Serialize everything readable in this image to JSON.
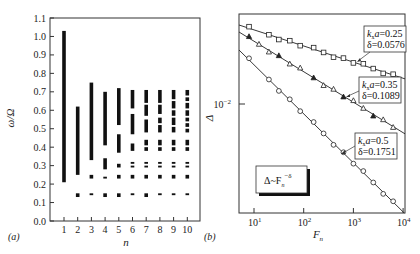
{
  "chart_data": [
    {
      "panel": "(a)",
      "type": "bar",
      "subtype": "range-bars (band spectrum)",
      "xlabel": "n",
      "ylabel": "ω/Ω",
      "ylim": [
        0.0,
        1.1
      ],
      "yticks": [
        "0.0",
        "0.1",
        "0.2",
        "0.3",
        "0.4",
        "0.5",
        "0.6",
        "0.7",
        "0.8",
        "0.9",
        "1.0",
        "1.1"
      ],
      "categories": [
        "1",
        "2",
        "3",
        "4",
        "5",
        "6",
        "7",
        "8",
        "9",
        "10"
      ],
      "bands": [
        {
          "n": 1,
          "ranges": [
            [
              0.21,
              1.03
            ]
          ]
        },
        {
          "n": 2,
          "ranges": [
            [
              0.13,
              0.15
            ],
            [
              0.25,
              0.62
            ]
          ]
        },
        {
          "n": 3,
          "ranges": [
            [
              0.14,
              0.15
            ],
            [
              0.23,
              0.25
            ],
            [
              0.33,
              0.75
            ]
          ]
        },
        {
          "n": 4,
          "ranges": [
            [
              0.13,
              0.15
            ],
            [
              0.23,
              0.24
            ],
            [
              0.28,
              0.34
            ],
            [
              0.41,
              0.7
            ]
          ]
        },
        {
          "n": 5,
          "ranges": [
            [
              0.13,
              0.15
            ],
            [
              0.23,
              0.25
            ],
            [
              0.29,
              0.31
            ],
            [
              0.37,
              0.47
            ],
            [
              0.52,
              0.72
            ]
          ]
        },
        {
          "n": 6,
          "ranges": [
            [
              0.14,
              0.15
            ],
            [
              0.23,
              0.25
            ],
            [
              0.29,
              0.3
            ],
            [
              0.31,
              0.32
            ],
            [
              0.38,
              0.42
            ],
            [
              0.47,
              0.58
            ],
            [
              0.61,
              0.71
            ]
          ]
        },
        {
          "n": 7,
          "ranges": [
            [
              0.13,
              0.15
            ],
            [
              0.23,
              0.25
            ],
            [
              0.29,
              0.3
            ],
            [
              0.31,
              0.32
            ],
            [
              0.38,
              0.4
            ],
            [
              0.41,
              0.44
            ],
            [
              0.48,
              0.55
            ],
            [
              0.57,
              0.63
            ],
            [
              0.64,
              0.71
            ]
          ]
        },
        {
          "n": 8,
          "ranges": [
            [
              0.14,
              0.15
            ],
            [
              0.23,
              0.25
            ],
            [
              0.29,
              0.3
            ],
            [
              0.31,
              0.32
            ],
            [
              0.38,
              0.4
            ],
            [
              0.41,
              0.44
            ],
            [
              0.48,
              0.52
            ],
            [
              0.53,
              0.56
            ],
            [
              0.58,
              0.63
            ],
            [
              0.64,
              0.71
            ]
          ]
        },
        {
          "n": 9,
          "ranges": [
            [
              0.14,
              0.15
            ],
            [
              0.23,
              0.25
            ],
            [
              0.29,
              0.3
            ],
            [
              0.31,
              0.32
            ],
            [
              0.38,
              0.4
            ],
            [
              0.41,
              0.44
            ],
            [
              0.48,
              0.51
            ],
            [
              0.52,
              0.56
            ],
            [
              0.57,
              0.6
            ],
            [
              0.61,
              0.65
            ],
            [
              0.66,
              0.71
            ]
          ]
        },
        {
          "n": 10,
          "ranges": [
            [
              0.14,
              0.15
            ],
            [
              0.23,
              0.25
            ],
            [
              0.29,
              0.3
            ],
            [
              0.31,
              0.32
            ],
            [
              0.38,
              0.4
            ],
            [
              0.41,
              0.44
            ],
            [
              0.48,
              0.5
            ],
            [
              0.51,
              0.53
            ],
            [
              0.54,
              0.56
            ],
            [
              0.57,
              0.6
            ],
            [
              0.61,
              0.64
            ],
            [
              0.65,
              0.67
            ],
            [
              0.68,
              0.71
            ]
          ]
        }
      ],
      "grid": false
    },
    {
      "panel": "(b)",
      "type": "scatter",
      "subtype": "log-log with power-law fit lines",
      "xlabel": "F_n",
      "ylabel": "Δ",
      "xscale": "log",
      "yscale": "log",
      "xticks": [
        "10^1",
        "10^2",
        "10^3",
        "10^4"
      ],
      "yticks": [
        "10^-2"
      ],
      "legend": "Δ~F_n^-δ",
      "series": [
        {
          "name": "k_x a=0.25",
          "delta": 0.0576,
          "marker": "square",
          "log10_F": [
            0.9,
            1.3,
            1.5,
            1.72,
            1.93,
            2.2,
            2.4,
            2.6,
            2.8,
            3.0,
            3.2,
            3.4,
            3.6,
            3.8
          ],
          "note": "points lie on fit line with slope -0.0576"
        },
        {
          "name": "k_x a=0.35",
          "delta": 0.1089,
          "marker": "triangle",
          "log10_F": [
            0.9,
            1.1,
            1.3,
            1.5,
            1.72,
            1.93,
            2.2,
            2.4,
            2.6,
            2.8,
            3.0,
            3.2,
            3.4,
            3.6,
            3.8
          ],
          "note": "points lie on fit line with slope -0.1089"
        },
        {
          "name": "k_x a=0.5",
          "delta": 0.1751,
          "marker": "circle",
          "log10_F": [
            0.9,
            1.3,
            1.5,
            1.72,
            1.93,
            2.2,
            2.4,
            2.6,
            2.8,
            3.0,
            3.2,
            3.4,
            3.6,
            3.8
          ],
          "note": "points lie on fit line with slope -0.1751"
        }
      ],
      "annotations": [
        {
          "line1": "k_x a=0.25",
          "line2": "δ=0.0576"
        },
        {
          "line1": "k_x a=0.35",
          "line2": "δ=0.1089"
        },
        {
          "line1": "k_x a=0.5",
          "line2": "δ=0.1751"
        }
      ],
      "grid": false
    }
  ],
  "panel_a": {
    "label": "(a)",
    "ylabel": "ω/Ω",
    "xlabel": "n",
    "yticks": [
      "0.0",
      "0.1",
      "0.2",
      "0.3",
      "0.4",
      "0.5",
      "0.6",
      "0.7",
      "0.8",
      "0.9",
      "1.0",
      "1.1"
    ],
    "xticks": [
      "1",
      "2",
      "3",
      "4",
      "5",
      "6",
      "7",
      "8",
      "9",
      "10"
    ]
  },
  "panel_b": {
    "label": "(b)",
    "ylabel": "Δ",
    "xlabel_main": "F",
    "xlabel_sub": "n",
    "ytick_base": "10",
    "ytick_exp": "−2",
    "xtick_base": "10",
    "xtick_exps": [
      "1",
      "2",
      "3",
      "4"
    ],
    "legend_main": "Δ~F",
    "legend_sub": "n",
    "legend_sup": "−δ",
    "annotations": [
      {
        "k": "k",
        "k_sub": "x",
        "k_rest": "a=0.25",
        "delta": "δ=0.0576"
      },
      {
        "k": "k",
        "k_sub": "x",
        "k_rest": "a=0.35",
        "delta": "δ=0.1089"
      },
      {
        "k": "k",
        "k_sub": "x",
        "k_rest": "a=0.5",
        "delta": "δ=0.1751"
      }
    ]
  }
}
